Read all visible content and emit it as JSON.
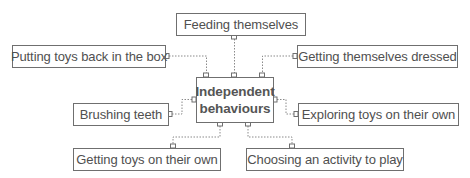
{
  "diagram": {
    "center": {
      "line1": "Independent",
      "line2": "behaviours"
    },
    "nodes": [
      {
        "id": "feeding",
        "label": "Feeding themselves"
      },
      {
        "id": "putting-toys",
        "label": "Putting toys back in the box"
      },
      {
        "id": "dressed",
        "label": "Getting themselves dressed"
      },
      {
        "id": "brushing",
        "label": "Brushing teeth"
      },
      {
        "id": "exploring",
        "label": "Exploring toys on their own"
      },
      {
        "id": "getting-toys",
        "label": "Getting toys on their own"
      },
      {
        "id": "choosing",
        "label": "Choosing an activity to play"
      }
    ],
    "colors": {
      "border": "#6f6f6f",
      "text": "#505050",
      "connector": "#8a8a8a"
    }
  }
}
